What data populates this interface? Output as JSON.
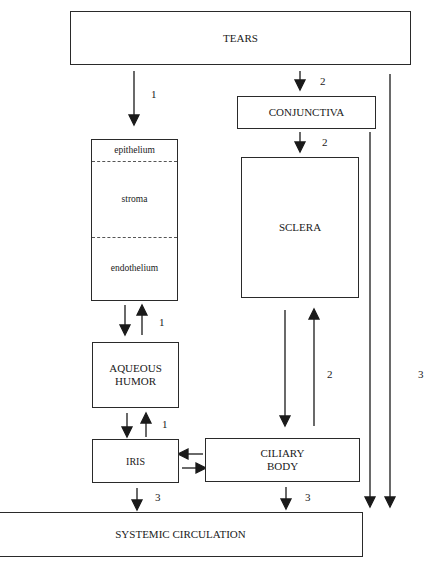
{
  "diagram": {
    "nodes": {
      "tears": "TEARS",
      "conjunctiva": "CONJUNCTIVA",
      "cornea_layers": [
        "epithelium",
        "stroma",
        "endothelium"
      ],
      "sclera": "SCLERA",
      "aqueous_humor_1": "AQUEOUS",
      "aqueous_humor_2": "HUMOR",
      "iris": "IRIS",
      "ciliary_body_1": "CILIARY",
      "ciliary_body_2": "BODY",
      "systemic_circulation": "SYSTEMIC CIRCULATION"
    },
    "edge_labels": {
      "tears_to_cornea": "1",
      "tears_to_conjunctiva": "2",
      "conjunctiva_to_sclera": "2",
      "cornea_aqueous": "1",
      "aqueous_iris": "1",
      "sclera_ciliary": "2",
      "tears_to_systemic": "3",
      "iris_to_systemic": "3",
      "ciliary_to_systemic": "3"
    }
  }
}
